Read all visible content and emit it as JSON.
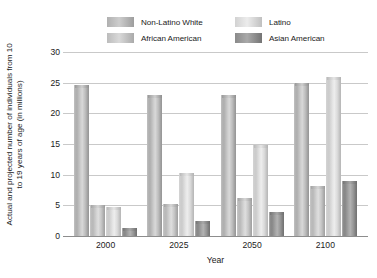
{
  "chart_data": {
    "type": "bar",
    "title": "",
    "subtitle": "",
    "xlabel": "Year",
    "ylabel": "Actual and projected number of individuals from 10 to 19 years of age (in millions)",
    "categories": [
      "2000",
      "2025",
      "2050",
      "2100"
    ],
    "ylim": [
      0,
      30
    ],
    "yticks": [
      "0",
      "5",
      "10",
      "15",
      "20",
      "25",
      "30"
    ],
    "ytick_values": [
      0,
      5,
      10,
      15,
      20,
      25,
      30
    ],
    "grid": true,
    "legend_position": "top-center",
    "series": [
      {
        "name": "Non-Latino White",
        "color": "#b8b8b8",
        "swatch_class": "sw-nlw",
        "fill_class": "fill-nlw",
        "values": [
          24.7,
          23.0,
          23.0,
          25.0
        ]
      },
      {
        "name": "African American",
        "color": "#c6c6c6",
        "swatch_class": "sw-aa",
        "fill_class": "fill-aa",
        "values": [
          5.0,
          5.3,
          6.2,
          8.2
        ]
      },
      {
        "name": "Latino",
        "color": "#dcdcdc",
        "swatch_class": "sw-lat",
        "fill_class": "fill-lat",
        "values": [
          4.8,
          10.2,
          14.8,
          26.0
        ]
      },
      {
        "name": "Asian American",
        "color": "#909090",
        "swatch_class": "sw-asa",
        "fill_class": "fill-asa",
        "values": [
          1.3,
          2.5,
          3.9,
          9.0
        ]
      }
    ],
    "legend_order": [
      "Non-Latino White",
      "Latino",
      "African American",
      "Asian American"
    ]
  },
  "legend": {
    "items": [
      {
        "label": "Non-Latino White",
        "swatch_class": "sw-nlw"
      },
      {
        "label": "Latino",
        "swatch_class": "sw-lat"
      },
      {
        "label": "African American",
        "swatch_class": "sw-aa"
      },
      {
        "label": "Asian American",
        "swatch_class": "sw-asa"
      }
    ]
  },
  "axes": {
    "y_title": "Actual and projected number of individuals from 10 to 19 years of age (in millions)",
    "x_title": "Year"
  }
}
